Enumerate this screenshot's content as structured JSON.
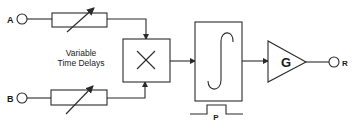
{
  "diagram": {
    "inputs": [
      {
        "id": "A",
        "label": "A"
      },
      {
        "id": "B",
        "label": "B"
      }
    ],
    "delays": {
      "caption_line1": "Variable",
      "caption_line2": "Time Delays"
    },
    "multiplier": {
      "symbol": "×"
    },
    "integrator": {
      "symbol": "∫",
      "gate_label": "P"
    },
    "amplifier": {
      "label": "G"
    },
    "output": {
      "label": "R"
    },
    "colors": {
      "line": "#2a2a2a",
      "background": "#ffffff",
      "text": "#1a1a1a"
    }
  }
}
